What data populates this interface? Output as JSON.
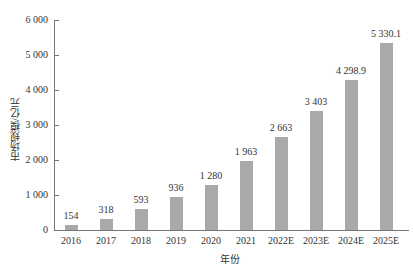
{
  "chart_data": {
    "type": "bar",
    "title": "",
    "xlabel": "年份",
    "ylabel": "市场规模/亿元",
    "categories": [
      "2016",
      "2017",
      "2018",
      "2019",
      "2020",
      "2021",
      "2022E",
      "2023E",
      "2024E",
      "2025E"
    ],
    "values": [
      154,
      318,
      593,
      936,
      1280,
      1963,
      2663,
      3403,
      4298.9,
      5330.1
    ],
    "value_labels": [
      "154",
      "318",
      "593",
      "936",
      "1 280",
      "1 963",
      "2 663",
      "3 403",
      "4 298.9",
      "5 330.1"
    ],
    "ylim": [
      0,
      6000
    ],
    "yticks": [
      0,
      1000,
      2000,
      3000,
      4000,
      5000,
      6000
    ],
    "ytick_labels": [
      "0",
      "1 000",
      "2 000",
      "3 000",
      "4 000",
      "5 000",
      "6 000"
    ],
    "grid": false,
    "legend": null,
    "bar_color": "#a9a9a9"
  }
}
